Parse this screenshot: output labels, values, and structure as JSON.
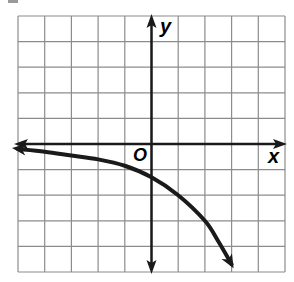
{
  "chart_data": {
    "type": "line",
    "title": "",
    "xlabel": "x",
    "ylabel": "y",
    "origin_label": "O",
    "xlim": [
      -5,
      5
    ],
    "ylim": [
      -5,
      5
    ],
    "grid": true,
    "grid_step": 1,
    "legend": null,
    "series": [
      {
        "name": "curve",
        "description": "decreasing exponential-type curve, asymptotic to about y=-0.2 on the left, crossing the y-axis near (0,-1.3), falling steeply to the right",
        "x": [
          -5,
          -4,
          -3,
          -2,
          -1,
          0,
          1,
          2,
          2.5,
          3
        ],
        "y": [
          -0.2,
          -0.3,
          -0.45,
          -0.6,
          -0.85,
          -1.3,
          -2.0,
          -3.0,
          -3.8,
          -4.7
        ],
        "arrows": [
          "left",
          "right"
        ]
      }
    ],
    "axes": {
      "x_axis_arrows": [
        "left",
        "right"
      ],
      "y_axis_arrows": [
        "up",
        "down"
      ]
    }
  },
  "labels": {
    "x_axis": "x",
    "y_axis": "y",
    "origin": "O"
  },
  "colors": {
    "grid": "#8c8c8c",
    "axis": "#1a1a1a",
    "curve": "#1a1a1a",
    "background": "#ffffff"
  }
}
